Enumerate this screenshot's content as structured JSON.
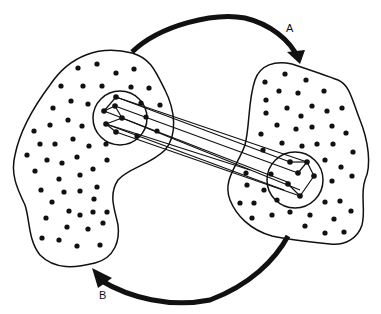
{
  "diagram": {
    "labels": {
      "arrow_a": "A",
      "arrow_b": "B"
    },
    "colors": {
      "ink": "#111111",
      "background": "#ffffff"
    },
    "regions": [
      {
        "name": "left-region",
        "dot_count": 55
      },
      {
        "name": "right-region",
        "dot_count": 45
      }
    ],
    "clusters": [
      {
        "name": "left-cluster",
        "center": [
          128,
          118
        ],
        "radius": 30
      },
      {
        "name": "right-cluster",
        "center": [
          300,
          180
        ],
        "radius": 30
      }
    ],
    "arrows": [
      {
        "label": "A",
        "from": "left-region",
        "to": "right-region",
        "direction": "clockwise-top"
      },
      {
        "label": "B",
        "from": "right-region",
        "to": "left-region",
        "direction": "clockwise-bottom"
      }
    ]
  }
}
